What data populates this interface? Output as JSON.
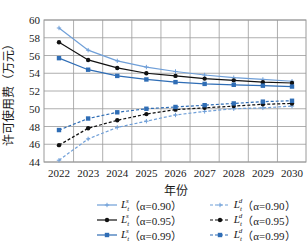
{
  "chart_data": {
    "type": "line",
    "title": "",
    "xlabel": "年份",
    "ylabel": "许可使用费（万元）",
    "x": [
      2022,
      2023,
      2024,
      2025,
      2026,
      2027,
      2028,
      2029,
      2030
    ],
    "xticks": [
      "2022",
      "2023",
      "2024",
      "2025",
      "2026",
      "2027",
      "2028",
      "2029",
      "2030"
    ],
    "yticks": [
      "44",
      "46",
      "48",
      "50",
      "52",
      "54",
      "56",
      "58",
      "60"
    ],
    "ylim": [
      44,
      60
    ],
    "grid": true,
    "legend_position": "bottom",
    "series": [
      {
        "name": "L_t^s（α=0.90）",
        "sym": "s",
        "alpha": "α=0.90",
        "color": "#6f9fd8",
        "dash": false,
        "marker": "plus",
        "values": [
          59.1,
          56.6,
          55.4,
          54.7,
          54.2,
          53.8,
          53.5,
          53.3,
          53.1
        ]
      },
      {
        "name": "L_t^d（α=0.90）",
        "sym": "d",
        "alpha": "α=0.90",
        "color": "#6f9fd8",
        "dash": true,
        "marker": "plus",
        "values": [
          44.2,
          46.6,
          47.9,
          48.6,
          49.3,
          49.7,
          50.0,
          50.1,
          50.3
        ]
      },
      {
        "name": "L_t^s（α=0.95）",
        "sym": "s",
        "alpha": "α=0.95",
        "color": "#111111",
        "dash": false,
        "marker": "circle",
        "values": [
          57.5,
          55.5,
          54.6,
          54.0,
          53.7,
          53.4,
          53.2,
          53.0,
          52.9
        ]
      },
      {
        "name": "L_t^d（α=0.95）",
        "sym": "d",
        "alpha": "α=0.95",
        "color": "#111111",
        "dash": true,
        "marker": "circle",
        "values": [
          45.9,
          47.8,
          48.7,
          49.4,
          49.9,
          50.1,
          50.3,
          50.5,
          50.6
        ]
      },
      {
        "name": "L_t^s（α=0.99）",
        "sym": "s",
        "alpha": "α=0.99",
        "color": "#2f6db5",
        "dash": false,
        "marker": "square",
        "values": [
          55.7,
          54.4,
          53.7,
          53.3,
          53.0,
          52.8,
          52.7,
          52.6,
          52.5
        ]
      },
      {
        "name": "L_t^d（α=0.99）",
        "sym": "d",
        "alpha": "α=0.99",
        "color": "#2f6db5",
        "dash": true,
        "marker": "square",
        "values": [
          47.6,
          48.9,
          49.6,
          50.0,
          50.2,
          50.4,
          50.6,
          50.8,
          50.9
        ]
      }
    ]
  },
  "legend": {
    "items": [
      {
        "label": "（α=0.90）",
        "sym": "s"
      },
      {
        "label": "（α=0.90）",
        "sym": "d"
      },
      {
        "label": "（α=0.95）",
        "sym": "s"
      },
      {
        "label": "（α=0.95）",
        "sym": "d"
      },
      {
        "label": "（α=0.99）",
        "sym": "s"
      },
      {
        "label": "（α=0.99）",
        "sym": "d"
      }
    ]
  }
}
